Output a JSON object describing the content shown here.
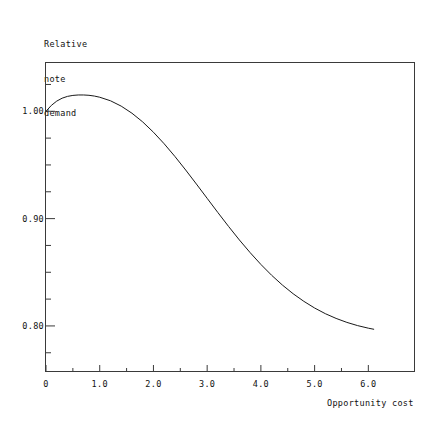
{
  "chart_data": {
    "type": "line",
    "title": "",
    "ylabel_lines": [
      "Relative",
      "note",
      "demand"
    ],
    "xlabel": "Opportunity cost",
    "xlim": [
      0,
      6.85
    ],
    "ylim": [
      0.758,
      1.045
    ],
    "grid": false,
    "legend": null,
    "xticks": [
      0,
      1.0,
      2.0,
      3.0,
      4.0,
      5.0,
      6.0
    ],
    "xtick_labels": [
      "0",
      "1.0",
      "2.0",
      "3.0",
      "4.0",
      "5.0",
      "6.0"
    ],
    "xtick_minor_count_between": 1,
    "yticks_major": [
      0.8,
      0.9,
      1.0
    ],
    "ytick_labels": [
      "0.80",
      "0.90",
      "1.00"
    ],
    "yticks_minor": [
      0.775,
      0.825,
      0.85,
      0.875,
      0.925,
      0.95,
      0.975,
      1.025
    ],
    "series": [
      {
        "name": "Relative note demand",
        "color": "#1a1a1a",
        "linewidth": 1.0,
        "x": [
          0.0,
          0.1,
          0.2,
          0.3,
          0.4,
          0.5,
          0.6,
          0.7,
          0.8,
          0.9,
          1.0,
          1.2,
          1.4,
          1.6,
          1.8,
          2.0,
          2.2,
          2.4,
          2.6,
          2.8,
          3.0,
          3.2,
          3.4,
          3.6,
          3.8,
          4.0,
          4.2,
          4.4,
          4.6,
          4.8,
          5.0,
          5.2,
          5.4,
          5.6,
          5.8,
          6.0,
          6.1
        ],
        "y": [
          1.0,
          1.0055,
          1.0095,
          1.0122,
          1.0139,
          1.0148,
          1.0152,
          1.0152,
          1.0149,
          1.0142,
          1.0131,
          1.0098,
          1.0048,
          0.9982,
          0.9901,
          0.9805,
          0.9697,
          0.9579,
          0.9453,
          0.9322,
          0.9189,
          0.9056,
          0.8926,
          0.8801,
          0.8683,
          0.8573,
          0.8472,
          0.8381,
          0.83,
          0.8229,
          0.8167,
          0.8114,
          0.807,
          0.8033,
          0.8003,
          0.7979,
          0.7969
        ]
      }
    ]
  },
  "axes": {
    "frame_color": "#3a3a3a"
  }
}
